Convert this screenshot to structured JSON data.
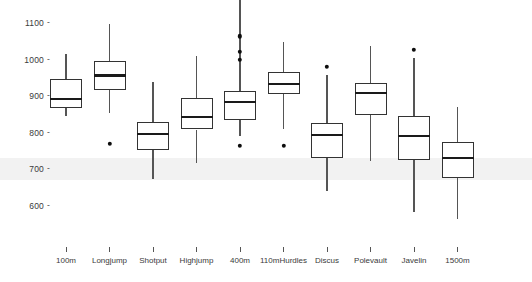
{
  "chart_data": {
    "type": "boxplot",
    "title": "",
    "xlabel": "",
    "ylabel": "",
    "ylim": [
      570,
      1120
    ],
    "grid": false,
    "legend": null,
    "yticks": [
      1100,
      1000,
      900,
      800,
      700,
      600
    ],
    "categories": [
      "100m",
      "Longjump",
      "Shotput",
      "Highjump",
      "400m",
      "110mHurdles",
      "Discus",
      "Polevault",
      "Javelin",
      "1500m"
    ],
    "series": [
      {
        "name": "100m",
        "whisker_low": 846,
        "q1": 867,
        "median": 892,
        "q3": 947,
        "whisker_high": 1015,
        "outliers": []
      },
      {
        "name": "Longjump",
        "whisker_low": 853,
        "q1": 918,
        "median": 957,
        "q3": 996,
        "whisker_high": 1097,
        "outliers": [
          770
        ]
      },
      {
        "name": "Shotput",
        "whisker_low": 674,
        "q1": 752,
        "median": 796,
        "q3": 830,
        "whisker_high": 939,
        "outliers": []
      },
      {
        "name": "Highjump",
        "whisker_low": 718,
        "q1": 809,
        "median": 843,
        "q3": 895,
        "whisker_high": 1009,
        "outliers": []
      },
      {
        "name": "400m",
        "whisker_low": 791,
        "q1": 835,
        "median": 884,
        "q3": 913,
        "whisker_high": 1973,
        "outliers": [
          1064,
          1022,
          999,
          765
        ]
      },
      {
        "name": "110mHurdles",
        "whisker_low": 809,
        "q1": 905,
        "median": 934,
        "q3": 965,
        "whisker_high": 1048,
        "outliers": [
          765
        ]
      },
      {
        "name": "Discus",
        "whisker_low": 640,
        "q1": 732,
        "median": 794,
        "q3": 827,
        "whisker_high": 957,
        "outliers": [
          981
        ]
      },
      {
        "name": "Polevault",
        "whisker_low": 723,
        "q1": 848,
        "median": 908,
        "q3": 936,
        "whisker_high": 1038,
        "outliers": []
      },
      {
        "name": "Javelin",
        "whisker_low": 583,
        "q1": 726,
        "median": 791,
        "q3": 845,
        "whisker_high": 1004,
        "outliers": [
          1026
        ]
      },
      {
        "name": "1500m",
        "whisker_low": 565,
        "q1": 677,
        "median": 731,
        "q3": 775,
        "whisker_high": 871,
        "outliers": []
      }
    ]
  },
  "axis": {
    "tick_dash": "-",
    "y_labels": [
      "1100",
      "1000",
      "900",
      "800",
      "700",
      "600"
    ]
  },
  "colors": {
    "box_stroke": "#333333",
    "median_stroke": "#1a1a1a",
    "whisker_stroke": "#555555",
    "outlier_fill": "#0d0d0d",
    "background": "#ffffff",
    "band": "#f0f0f0"
  }
}
